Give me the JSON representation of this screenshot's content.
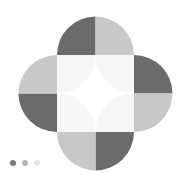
{
  "logo": {
    "name": "quatrefoil-flower-logo",
    "shape": "quatrefoil",
    "background_color": "#FFFFFF",
    "colors": {
      "dark_gray": "#6B6B6B",
      "light_gray": "#C8C8C8",
      "center_square": "#F7F7F7",
      "star": "#FFFFFF"
    },
    "geometry": {
      "center_x": 94.5,
      "center_y": 93.5,
      "square_left": 57,
      "square_top": 55,
      "square_size": 77,
      "lobe_radius": 38.5,
      "star_arc_radius": 38.5
    },
    "petals": [
      {
        "name": "top-petal",
        "halves": [
          {
            "name": "top-petal-left-half",
            "color": "#6B6B6B"
          },
          {
            "name": "top-petal-right-half",
            "color": "#C8C8C8"
          }
        ]
      },
      {
        "name": "right-petal",
        "halves": [
          {
            "name": "right-petal-top-half",
            "color": "#6B6B6B"
          },
          {
            "name": "right-petal-bottom-half",
            "color": "#C8C8C8"
          }
        ]
      },
      {
        "name": "bottom-petal",
        "halves": [
          {
            "name": "bottom-petal-left-half",
            "color": "#C8C8C8"
          },
          {
            "name": "bottom-petal-right-half",
            "color": "#6B6B6B"
          }
        ]
      },
      {
        "name": "left-petal",
        "halves": [
          {
            "name": "left-petal-top-half",
            "color": "#C8C8C8"
          },
          {
            "name": "left-petal-bottom-half",
            "color": "#6B6B6B"
          }
        ]
      }
    ],
    "center": {
      "name": "center-square",
      "color": "#F7F7F7",
      "star_name": "four-pointed-star",
      "star_color": "#FFFFFF"
    }
  },
  "carousel": {
    "name": "carousel-indicator",
    "total": 3,
    "active_index": 0,
    "dots": [
      {
        "label": "1",
        "color": "#7A7A7A",
        "opacity": "1"
      },
      {
        "label": "2",
        "color": "#B8B8B8",
        "opacity": "1"
      },
      {
        "label": "3",
        "color": "#E4E4E4",
        "opacity": "1"
      }
    ]
  }
}
